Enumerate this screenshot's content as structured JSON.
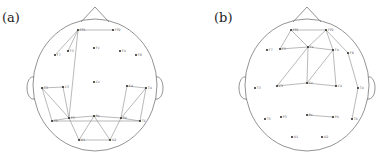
{
  "panels": [
    {
      "id": "a",
      "label": "(a)",
      "offset_x": 0,
      "head": {
        "cx": 95,
        "cy": 85,
        "rx": 62,
        "ry": 66
      },
      "nodes": [
        {
          "name": "FP1",
          "x": 78,
          "y": 30
        },
        {
          "name": "FP2",
          "x": 113,
          "y": 30
        },
        {
          "name": "F7",
          "x": 55,
          "y": 55
        },
        {
          "name": "F3",
          "x": 68,
          "y": 51
        },
        {
          "name": "Fz",
          "x": 94,
          "y": 48
        },
        {
          "name": "F4",
          "x": 120,
          "y": 51
        },
        {
          "name": "F8",
          "x": 136,
          "y": 55
        },
        {
          "name": "T3",
          "x": 42,
          "y": 88
        },
        {
          "name": "C3",
          "x": 63,
          "y": 87
        },
        {
          "name": "Cz",
          "x": 94,
          "y": 82
        },
        {
          "name": "C4",
          "x": 127,
          "y": 86
        },
        {
          "name": "T4",
          "x": 146,
          "y": 88
        },
        {
          "name": "T5",
          "x": 52,
          "y": 121
        },
        {
          "name": "P3",
          "x": 69,
          "y": 118
        },
        {
          "name": "Pz",
          "x": 94,
          "y": 116
        },
        {
          "name": "P4",
          "x": 121,
          "y": 118
        },
        {
          "name": "T6",
          "x": 140,
          "y": 121
        },
        {
          "name": "O1",
          "x": 79,
          "y": 140
        },
        {
          "name": "O2",
          "x": 110,
          "y": 140
        }
      ],
      "edges": [
        [
          "FP1",
          "FP2"
        ],
        [
          "FP1",
          "F7"
        ],
        [
          "FP1",
          "F3"
        ],
        [
          "FP1",
          "P3"
        ],
        [
          "T3",
          "C3"
        ],
        [
          "T3",
          "T5"
        ],
        [
          "T3",
          "P3"
        ],
        [
          "C3",
          "P3"
        ],
        [
          "C4",
          "T4"
        ],
        [
          "C4",
          "P4"
        ],
        [
          "T4",
          "T6"
        ],
        [
          "T4",
          "P4"
        ],
        [
          "T5",
          "P3"
        ],
        [
          "T5",
          "T6"
        ],
        [
          "P3",
          "Pz"
        ],
        [
          "Pz",
          "P4"
        ],
        [
          "P4",
          "T6"
        ],
        [
          "P3",
          "O1"
        ],
        [
          "Pz",
          "O1"
        ],
        [
          "Pz",
          "O2"
        ],
        [
          "P4",
          "O2"
        ],
        [
          "O1",
          "O2"
        ]
      ]
    },
    {
      "id": "b",
      "label": "(b)",
      "offset_x": 0,
      "head": {
        "cx": 307,
        "cy": 85,
        "rx": 62,
        "ry": 66
      },
      "nodes": [
        {
          "name": "FP1",
          "x": 291,
          "y": 30
        },
        {
          "name": "FP2",
          "x": 326,
          "y": 30
        },
        {
          "name": "F7",
          "x": 267,
          "y": 50
        },
        {
          "name": "F3",
          "x": 280,
          "y": 49
        },
        {
          "name": "Fz",
          "x": 308,
          "y": 47
        },
        {
          "name": "F4",
          "x": 333,
          "y": 50
        },
        {
          "name": "F8",
          "x": 348,
          "y": 53
        },
        {
          "name": "T3",
          "x": 255,
          "y": 88
        },
        {
          "name": "C3",
          "x": 277,
          "y": 86
        },
        {
          "name": "Cz",
          "x": 307,
          "y": 83
        },
        {
          "name": "C4",
          "x": 336,
          "y": 86
        },
        {
          "name": "T4",
          "x": 358,
          "y": 88
        },
        {
          "name": "T5",
          "x": 265,
          "y": 119
        },
        {
          "name": "P3",
          "x": 281,
          "y": 117
        },
        {
          "name": "Pz",
          "x": 307,
          "y": 115
        },
        {
          "name": "P4",
          "x": 333,
          "y": 117
        },
        {
          "name": "T6",
          "x": 352,
          "y": 119
        },
        {
          "name": "O1",
          "x": 292,
          "y": 137
        },
        {
          "name": "O2",
          "x": 322,
          "y": 137
        }
      ],
      "edges": [
        [
          "FP1",
          "FP2"
        ],
        [
          "FP1",
          "F3"
        ],
        [
          "FP1",
          "Fz"
        ],
        [
          "FP2",
          "Fz"
        ],
        [
          "FP2",
          "F4"
        ],
        [
          "FP2",
          "F8"
        ],
        [
          "F3",
          "Fz"
        ],
        [
          "Fz",
          "F4"
        ],
        [
          "F4",
          "C4"
        ],
        [
          "Fz",
          "Cz"
        ],
        [
          "F4",
          "Cz"
        ],
        [
          "Fz",
          "C3"
        ],
        [
          "C3",
          "Cz"
        ],
        [
          "Cz",
          "C4"
        ],
        [
          "F8",
          "T4"
        ],
        [
          "T4",
          "T6"
        ],
        [
          "Pz",
          "P4"
        ]
      ]
    }
  ]
}
